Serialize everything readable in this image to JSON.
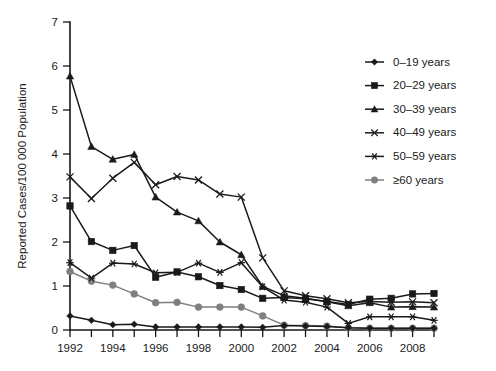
{
  "chart_data": {
    "type": "line",
    "title": "",
    "xlabel": "",
    "ylabel": "Reported Cases/100 000 Population",
    "ylim": [
      0,
      7
    ],
    "xlim": [
      1992,
      2009
    ],
    "yticks": [
      0,
      1,
      2,
      3,
      4,
      5,
      6,
      7
    ],
    "xticks": [
      1992,
      1993,
      1994,
      1995,
      1996,
      1997,
      1998,
      1999,
      2000,
      2001,
      2002,
      2003,
      2004,
      2005,
      2006,
      2007,
      2008,
      2009
    ],
    "xtick_labels": [
      "1992",
      "",
      "1994",
      "",
      "1996",
      "",
      "1998",
      "",
      "2000",
      "",
      "2002",
      "",
      "2004",
      "",
      "2006",
      "",
      "2008",
      ""
    ],
    "grid": false,
    "legend_position": "top-right",
    "x": [
      1992,
      1993,
      1994,
      1995,
      1996,
      1997,
      1998,
      1999,
      2000,
      2001,
      2002,
      2003,
      2004,
      2005,
      2006,
      2007,
      2008,
      2009
    ],
    "series": [
      {
        "name": "0–19 years",
        "marker": "diamond",
        "color": "#1a1a1a",
        "values": [
          0.32,
          0.22,
          0.12,
          0.13,
          0.07,
          0.07,
          0.07,
          0.07,
          0.07,
          0.06,
          0.1,
          0.09,
          0.08,
          0.05,
          0.04,
          0.04,
          0.04,
          0.04
        ]
      },
      {
        "name": "20–29 years",
        "marker": "square",
        "color": "#1a1a1a",
        "values": [
          2.82,
          2.01,
          1.81,
          1.92,
          1.2,
          1.32,
          1.21,
          1.01,
          0.92,
          0.72,
          0.74,
          0.71,
          0.65,
          0.58,
          0.7,
          0.72,
          0.82,
          0.83
        ]
      },
      {
        "name": "30–39 years",
        "marker": "triangle",
        "color": "#1a1a1a",
        "values": [
          5.77,
          4.17,
          3.88,
          3.99,
          3.02,
          2.68,
          2.48,
          2.0,
          1.71,
          0.99,
          0.78,
          0.72,
          0.64,
          0.55,
          0.62,
          0.52,
          0.53,
          0.52
        ]
      },
      {
        "name": "40–49 years",
        "marker": "cross",
        "color": "#1a1a1a",
        "values": [
          3.48,
          2.99,
          3.45,
          3.81,
          3.3,
          3.49,
          3.41,
          3.09,
          3.02,
          1.64,
          0.89,
          0.78,
          0.71,
          0.62,
          0.65,
          0.63,
          0.64,
          0.62
        ]
      },
      {
        "name": "50–59 years",
        "marker": "asterisk",
        "color": "#1a1a1a",
        "values": [
          1.53,
          1.18,
          1.52,
          1.5,
          1.3,
          1.31,
          1.52,
          1.31,
          1.53,
          0.98,
          0.68,
          0.63,
          0.52,
          0.15,
          0.3,
          0.3,
          0.3,
          0.22
        ]
      },
      {
        "name": "≥60 years",
        "marker": "circle",
        "color": "#7f7f7f",
        "values": [
          1.33,
          1.11,
          1.02,
          0.82,
          0.62,
          0.63,
          0.52,
          0.52,
          0.52,
          0.32,
          0.11,
          0.1,
          0.09,
          0.05,
          0.04,
          0.04,
          0.04,
          0.04
        ]
      }
    ]
  },
  "legend": {
    "items": [
      {
        "label": "0–19 years"
      },
      {
        "label": "20–29 years"
      },
      {
        "label": "30–39 years"
      },
      {
        "label": "40–49 years"
      },
      {
        "label": "50–59 years"
      },
      {
        "label": "≥60 years"
      }
    ]
  }
}
